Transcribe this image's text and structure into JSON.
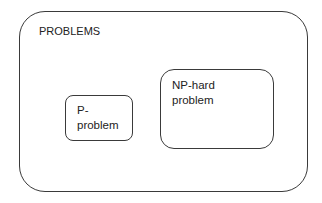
{
  "diagram": {
    "type": "set-containment",
    "outer": {
      "label": "PROBLEMS"
    },
    "inner": [
      {
        "id": "p",
        "label": "P-\nproblem"
      },
      {
        "id": "np-hard",
        "label": "NP-hard\nproblem"
      }
    ]
  }
}
